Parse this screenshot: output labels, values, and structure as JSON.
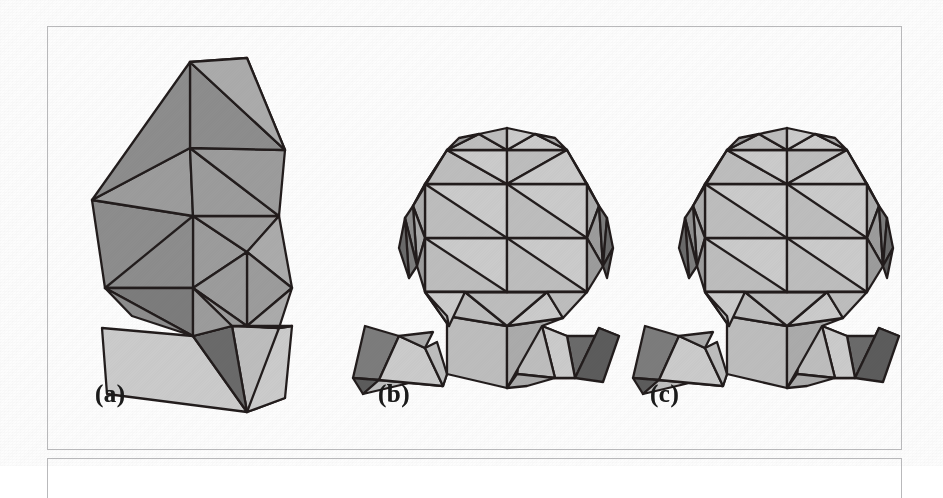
{
  "figure": {
    "kind": "polygonal-head-models",
    "background_color": "#fdfdfd",
    "frames": [
      {
        "name": "main-frame",
        "x": 47,
        "y": 26,
        "width": 855,
        "height": 424,
        "border_color": "#b9b9bb"
      },
      {
        "name": "next-frame",
        "x": 47,
        "y": 458,
        "width": 855,
        "height": 40,
        "border_color": "#b9b9bb"
      }
    ],
    "palette": {
      "edge": "#241f1f",
      "face_light": "#c8c8c8",
      "face_mid_light": "#b4b4b4",
      "face_mid": "#9c9c9c",
      "face_mid_dark": "#8a8a8a",
      "face_dark": "#6f6f6f",
      "face_darkest": "#5a5a5a",
      "caption_color": "#1b1b1b"
    },
    "captions": [
      {
        "name": "caption-a",
        "label": "(a)",
        "x": 95,
        "y": 381
      },
      {
        "name": "caption-b",
        "label": "(b)",
        "x": 378,
        "y": 381
      },
      {
        "name": "caption-c",
        "label": "(c)",
        "x": 650,
        "y": 381
      }
    ],
    "models": [
      {
        "id": "model-a",
        "label": "(a)",
        "detail": "coarse",
        "approx_triangle_count": 14,
        "bbox": {
          "x": 88,
          "y": 58,
          "width": 185,
          "height": 320
        }
      },
      {
        "id": "model-b",
        "label": "(b)",
        "detail": "medium",
        "approx_triangle_count": 60,
        "bbox": {
          "x": 355,
          "y": 100,
          "width": 230,
          "height": 278
        }
      },
      {
        "id": "model-c",
        "label": "(c)",
        "detail": "fine",
        "approx_triangle_count": 64,
        "bbox": {
          "x": 635,
          "y": 100,
          "width": 230,
          "height": 278
        }
      }
    ]
  }
}
